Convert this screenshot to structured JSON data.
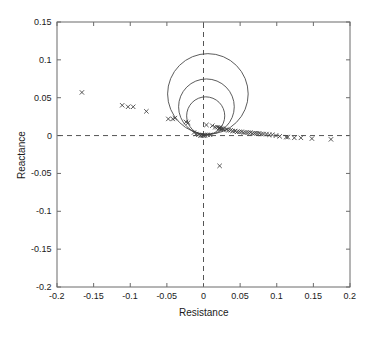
{
  "chart_data": {
    "type": "scatter",
    "title": "",
    "xlabel": "Resistance",
    "ylabel": "Reactance",
    "xlim": [
      -0.2,
      0.2
    ],
    "ylim": [
      -0.2,
      0.15
    ],
    "xticks": [
      -0.2,
      -0.15,
      -0.1,
      -0.05,
      0,
      0.05,
      0.1,
      0.15,
      0.2
    ],
    "xticklabels": [
      "-0.2",
      "-0.15",
      "-0.1",
      "-0.05",
      "0",
      "0.05",
      "0.1",
      "0.15",
      "0.2"
    ],
    "yticks": [
      -0.2,
      -0.15,
      -0.1,
      -0.05,
      0,
      0.05,
      0.1,
      0.15
    ],
    "yticklabels": [
      "-0.2",
      "-0.15",
      "-0.1",
      "-0.05",
      "0",
      "0.05",
      "0.1",
      "0.15"
    ],
    "grid": false,
    "legend": null,
    "reference_lines": [
      {
        "name": "zero-reactance-line",
        "orientation": "horizontal",
        "value": 0,
        "style": "dashed"
      },
      {
        "name": "zero-resistance-line",
        "orientation": "vertical",
        "value": 0,
        "style": "dashed"
      }
    ],
    "fit_circles": [
      {
        "name": "outer-fit-circle",
        "center_x": 0.006,
        "center_y": 0.055,
        "radius": 0.055
      },
      {
        "name": "middle-fit-circle",
        "center_x": 0.004,
        "center_y": 0.038,
        "radius": 0.038
      },
      {
        "name": "inner-fit-circle",
        "center_x": 0.003,
        "center_y": 0.026,
        "radius": 0.026
      }
    ],
    "series": [
      {
        "name": "impedance-data",
        "marker": "x",
        "color": "#3a3a3a",
        "points": [
          [
            -0.166,
            0.057
          ],
          [
            -0.111,
            0.04
          ],
          [
            -0.103,
            0.038
          ],
          [
            -0.096,
            0.038
          ],
          [
            -0.078,
            0.032
          ],
          [
            -0.048,
            0.022
          ],
          [
            -0.042,
            0.022
          ],
          [
            -0.039,
            0.023
          ],
          [
            -0.024,
            0.018
          ],
          [
            -0.021,
            0.017
          ],
          [
            -0.013,
            0.004
          ],
          [
            -0.01,
            0.002
          ],
          [
            -0.007,
            0.001
          ],
          [
            -0.004,
            0.0
          ],
          [
            -0.002,
            0.0
          ],
          [
            0.0,
            0.0
          ],
          [
            0.002,
            0.0
          ],
          [
            0.004,
            0.014
          ],
          [
            0.006,
            0.001
          ],
          [
            0.009,
            0.001
          ],
          [
            0.012,
            0.013
          ],
          [
            0.016,
            0.011
          ],
          [
            0.019,
            0.011
          ],
          [
            0.021,
            0.01
          ],
          [
            0.022,
            0.01
          ],
          [
            0.023,
            0.01
          ],
          [
            0.024,
            0.009
          ],
          [
            0.026,
            0.009
          ],
          [
            0.028,
            0.008
          ],
          [
            0.031,
            0.008
          ],
          [
            0.034,
            0.007
          ],
          [
            0.037,
            0.007
          ],
          [
            0.04,
            0.006
          ],
          [
            0.043,
            0.006
          ],
          [
            0.046,
            0.005
          ],
          [
            0.049,
            0.005
          ],
          [
            0.052,
            0.005
          ],
          [
            0.055,
            0.004
          ],
          [
            0.058,
            0.004
          ],
          [
            0.061,
            0.004
          ],
          [
            0.064,
            0.004
          ],
          [
            0.067,
            0.003
          ],
          [
            0.07,
            0.003
          ],
          [
            0.073,
            0.003
          ],
          [
            0.076,
            0.003
          ],
          [
            0.079,
            0.002
          ],
          [
            0.082,
            0.002
          ],
          [
            0.086,
            0.002
          ],
          [
            0.09,
            0.001
          ],
          [
            0.094,
            0.001
          ],
          [
            0.099,
            0.0
          ],
          [
            0.104,
            -0.001
          ],
          [
            0.113,
            -0.002
          ],
          [
            0.115,
            -0.002
          ],
          [
            0.124,
            -0.003
          ],
          [
            0.133,
            -0.003
          ],
          [
            0.148,
            -0.004
          ],
          [
            0.174,
            -0.005
          ],
          [
            0.022,
            -0.04
          ]
        ]
      }
    ]
  },
  "axes": {
    "frame_color": "#6b6b6b",
    "tick_color": "#6b6b6b",
    "dash_color": "#555555"
  }
}
